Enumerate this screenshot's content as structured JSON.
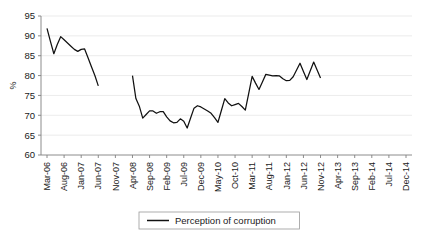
{
  "chart_data": {
    "type": "line",
    "title": "",
    "subtitle": "",
    "xlabel": "",
    "ylabel": "%",
    "ylim": [
      60,
      95
    ],
    "yticks": [
      60,
      65,
      70,
      75,
      80,
      85,
      90,
      95
    ],
    "grid": true,
    "legend_position": "bottom",
    "legend_entries": [
      "Perception of corruption"
    ],
    "annotations": [
      "Series is broken: a data gap separates the Mar-06..Nov-07 segment from the Apr-08..Dec-14 segment."
    ],
    "xtick_labels": [
      "Mar-06",
      "Aug-06",
      "Jan-07",
      "Jun-07",
      "Nov-07",
      "Apr-08",
      "Sep-08",
      "Feb-09",
      "Jul-09",
      "Dec-09",
      "May-10",
      "Oct-10",
      "Mar-11",
      "Aug-11",
      "Jan-12",
      "Jun-12",
      "Nov-12",
      "Apr-13",
      "Sep-13",
      "Feb-14",
      "Jul-14",
      "Dec-14"
    ],
    "xtick_interval_months": 5,
    "x_start_label": "Mar-06",
    "series": [
      {
        "name": "Perception of corruption",
        "color": "#111111",
        "segments": [
          {
            "start_label": "Mar-06",
            "points": [
              {
                "x": "Mar-06",
                "y": 91.9
              },
              {
                "x": "Apr-06",
                "y": 88.6
              },
              {
                "x": "May-06",
                "y": 85.5
              },
              {
                "x": "Jun-06",
                "y": 87.8
              },
              {
                "x": "Jul-06",
                "y": 89.8
              },
              {
                "x": "Aug-06",
                "y": 89.0
              },
              {
                "x": "Sep-06",
                "y": 88.2
              },
              {
                "x": "Oct-06",
                "y": 87.4
              },
              {
                "x": "Nov-06",
                "y": 86.6
              },
              {
                "x": "Dec-06",
                "y": 86.1
              },
              {
                "x": "Jan-07",
                "y": 86.6
              },
              {
                "x": "Feb-07",
                "y": 86.7
              },
              {
                "x": "Mar-07",
                "y": 84.5
              },
              {
                "x": "Apr-07",
                "y": 82.2
              },
              {
                "x": "May-07",
                "y": 80.0
              },
              {
                "x": "Jun-07",
                "y": 77.4
              }
            ]
          },
          {
            "start_label": "Apr-08",
            "points": [
              {
                "x": "Apr-08",
                "y": 80.0
              },
              {
                "x": "May-08",
                "y": 74.2
              },
              {
                "x": "Jun-08",
                "y": 72.3
              },
              {
                "x": "Jul-08",
                "y": 69.3
              },
              {
                "x": "Aug-08",
                "y": 70.2
              },
              {
                "x": "Sep-08",
                "y": 71.1
              },
              {
                "x": "Oct-08",
                "y": 71.1
              },
              {
                "x": "Nov-08",
                "y": 70.5
              },
              {
                "x": "Dec-08",
                "y": 70.9
              },
              {
                "x": "Jan-09",
                "y": 70.9
              },
              {
                "x": "Feb-09",
                "y": 69.6
              },
              {
                "x": "Mar-09",
                "y": 68.6
              },
              {
                "x": "Apr-09",
                "y": 68.1
              },
              {
                "x": "May-09",
                "y": 68.2
              },
              {
                "x": "Jun-09",
                "y": 69.1
              },
              {
                "x": "Jul-09",
                "y": 68.5
              },
              {
                "x": "Aug-09",
                "y": 66.8
              },
              {
                "x": "Sep-09",
                "y": 69.3
              },
              {
                "x": "Oct-09",
                "y": 71.8
              },
              {
                "x": "Nov-09",
                "y": 72.4
              },
              {
                "x": "Dec-09",
                "y": 72.1
              },
              {
                "x": "Jan-10",
                "y": 71.6
              },
              {
                "x": "Feb-10",
                "y": 71.1
              },
              {
                "x": "Mar-10",
                "y": 70.5
              },
              {
                "x": "Apr-10",
                "y": 69.4
              },
              {
                "x": "May-10",
                "y": 68.2
              },
              {
                "x": "Jun-10",
                "y": 71.2
              },
              {
                "x": "Jul-10",
                "y": 74.2
              },
              {
                "x": "Aug-10",
                "y": 73.1
              },
              {
                "x": "Sep-10",
                "y": 72.4
              },
              {
                "x": "Oct-10",
                "y": 72.7
              },
              {
                "x": "Nov-10",
                "y": 73.0
              },
              {
                "x": "Dec-10",
                "y": 72.2
              },
              {
                "x": "Jan-11",
                "y": 71.3
              },
              {
                "x": "Feb-11",
                "y": 75.5
              },
              {
                "x": "Mar-11",
                "y": 79.8
              },
              {
                "x": "Apr-11",
                "y": 78.1
              },
              {
                "x": "May-11",
                "y": 76.5
              },
              {
                "x": "Jun-11",
                "y": 78.4
              },
              {
                "x": "Jul-11",
                "y": 80.3
              },
              {
                "x": "Aug-11",
                "y": 80.1
              },
              {
                "x": "Sep-11",
                "y": 79.9
              },
              {
                "x": "Oct-11",
                "y": 80.0
              },
              {
                "x": "Nov-11",
                "y": 79.9
              },
              {
                "x": "Dec-11",
                "y": 79.2
              },
              {
                "x": "Jan-12",
                "y": 78.7
              },
              {
                "x": "Feb-12",
                "y": 78.8
              },
              {
                "x": "Mar-12",
                "y": 79.7
              },
              {
                "x": "Apr-12",
                "y": 81.4
              },
              {
                "x": "May-12",
                "y": 83.1
              },
              {
                "x": "Jun-12",
                "y": 81.0
              },
              {
                "x": "Jul-12",
                "y": 79.0
              },
              {
                "x": "Aug-12",
                "y": 81.2
              },
              {
                "x": "Sep-12",
                "y": 83.4
              },
              {
                "x": "Oct-12",
                "y": 81.4
              },
              {
                "x": "Nov-12",
                "y": 79.4
              }
            ]
          }
        ]
      }
    ]
  },
  "legend": {
    "label": "Perception of corruption"
  },
  "axes": {
    "y_axis_title": "%"
  }
}
